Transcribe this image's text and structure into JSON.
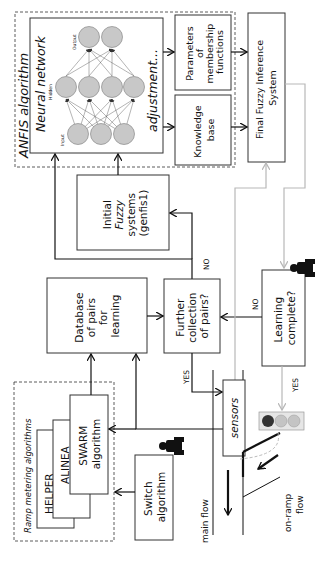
{
  "diagram": {
    "orientation": "rotated 90 degrees counter-clockwise",
    "anfis": {
      "group_label": "ANFIS algorithm",
      "neural_network_title": "Neural network",
      "layer_labels": {
        "input": "Input",
        "hidden": "Hidden",
        "output": "Output"
      },
      "layer_sizes": {
        "input": 3,
        "hidden": 4,
        "output": 2
      },
      "adjustment_label": "adjustment...",
      "parameters_box": [
        "Parameters",
        "of",
        "membership",
        "functions"
      ],
      "knowledge_box": [
        "Knowledge",
        "base"
      ]
    },
    "final_fis": [
      "Final Fuzzy Inference",
      "System"
    ],
    "initial_fuzzy": [
      "Initial",
      "Fuzzy",
      "systems",
      "(genfis1)"
    ],
    "database": [
      "Database",
      "of pairs",
      "for",
      "learning"
    ],
    "further_collection": [
      "Further",
      "collection",
      "of pairs?"
    ],
    "learning_complete": [
      "Learning",
      "complete?"
    ],
    "ramp_group": {
      "label": "Ramp metering algorithms",
      "algorithms": [
        {
          "label": [
            "HELPER"
          ]
        },
        {
          "label": [
            "ALINEA"
          ]
        },
        {
          "label": [
            "SWARM",
            "algorithm"
          ]
        }
      ]
    },
    "switch_algorithm": [
      "Switch",
      "algorithm"
    ],
    "sensors": "sensors",
    "road": {
      "main_flow": "main flow",
      "on_ramp_flow": [
        "on-ramp",
        "flow"
      ]
    },
    "edge_labels": {
      "no_top": "NO",
      "no_mid": "NO",
      "yes_left": "YES",
      "yes_right": "YES"
    },
    "traffic_light": {
      "lamps": [
        "#333333",
        "#bdbdbd",
        "#bdbdbd"
      ]
    },
    "colors": {
      "line": "#111111",
      "feedback_line": "#b8b8b8",
      "node_fill": "#c8c8c8",
      "operator_icon": "#111111"
    }
  }
}
